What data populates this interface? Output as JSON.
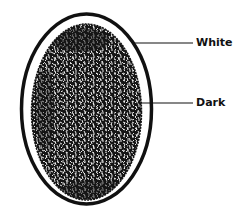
{
  "diagram": {
    "colors": {
      "background": "#ffffff",
      "outline": "#111111",
      "dark_fill": "#151515",
      "speckle": "#ffffff"
    },
    "shapes": {
      "outer_oval": {
        "cx": 86.5,
        "cy": 109,
        "rx": 65,
        "ry": 95
      },
      "inner_dark": {
        "cx": 86.5,
        "cy": 112,
        "rx": 55,
        "ry": 88
      }
    },
    "labels": [
      {
        "text": "White",
        "target": "outer white layer",
        "line_from": [
          132,
          43
        ],
        "line_to": [
          193,
          43
        ]
      },
      {
        "text": "Dark",
        "target": "inner dark region",
        "line_from": [
          138,
          103
        ],
        "line_to": [
          193,
          103
        ]
      }
    ]
  }
}
